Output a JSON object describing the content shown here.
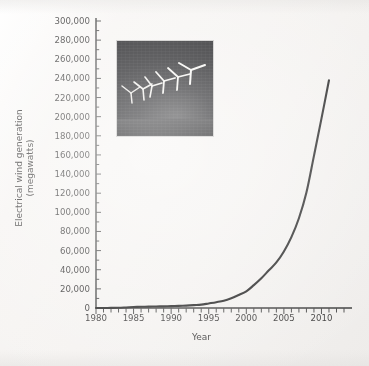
{
  "chart_data": {
    "type": "line",
    "title": "",
    "xlabel": "Year",
    "ylabel": "Electrical wind generation\n(megawatts)",
    "ylabel_line1": "Electrical wind generation",
    "ylabel_line2": "(megawatts)",
    "xlim": [
      1980,
      2013
    ],
    "ylim": [
      0,
      300000
    ],
    "grid": false,
    "legend": "none",
    "x_tick_labels": [
      "1980",
      "1985",
      "1990",
      "1995",
      "2000",
      "2005",
      "2010"
    ],
    "x_tick_label_values": [
      1980,
      1985,
      1990,
      1995,
      2000,
      2005,
      2010
    ],
    "x_minor_tick_step": 1,
    "y_tick_labels": [
      "0",
      "20,000",
      "40,000",
      "60,000",
      "80,000",
      "100,000",
      "120,000",
      "140,000",
      "160,000",
      "180,000",
      "200,000",
      "220,000",
      "240,000",
      "260,000",
      "280,000",
      "300,000"
    ],
    "y_tick_values": [
      0,
      20000,
      40000,
      60000,
      80000,
      100000,
      120000,
      140000,
      160000,
      180000,
      200000,
      220000,
      240000,
      260000,
      280000,
      300000
    ],
    "y_minor_tick_step": 10000,
    "series": [
      {
        "name": "Electrical wind generation",
        "color": "#262626",
        "x": [
          1980,
          1981,
          1982,
          1983,
          1984,
          1985,
          1986,
          1987,
          1988,
          1989,
          1990,
          1991,
          1992,
          1993,
          1994,
          1995,
          1996,
          1997,
          1998,
          1999,
          2000,
          2001,
          2002,
          2003,
          2004,
          2005,
          2006,
          2007,
          2008,
          2009,
          2010,
          2011
        ],
        "values": [
          10,
          25,
          90,
          210,
          600,
          1020,
          1270,
          1450,
          1580,
          1730,
          1930,
          2170,
          2510,
          2990,
          3490,
          4780,
          6100,
          7600,
          10200,
          13600,
          17400,
          23900,
          31100,
          39431,
          47620,
          59091,
          74052,
          93820,
          120690,
          159050,
          197950,
          238000
        ]
      }
    ],
    "annotations": [
      {
        "name": "wind-turbine-photo",
        "description": "Photograph of six white wind turbines against a dark night sky",
        "turbine_count": 6
      }
    ]
  },
  "axes": {
    "y_axis_title_line1": "Electrical wind generation",
    "y_axis_title_line2": "(megawatts)",
    "x_axis_title": "Year"
  },
  "colors": {
    "curve": "#262626",
    "axis": "#3a3a3a",
    "text": "#3d3c3c",
    "background": "#f6f4f2",
    "photo_background": "#0d0d10",
    "turbine": "#e8e6e2"
  }
}
